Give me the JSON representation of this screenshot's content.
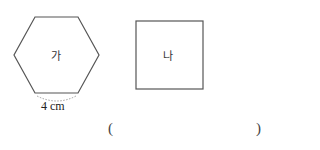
{
  "figures": {
    "hexagon": {
      "label": "가",
      "side_label": "4 cm",
      "stroke": "#555555"
    },
    "square": {
      "label": "나",
      "stroke": "#555555"
    }
  },
  "answer": {
    "open": "(",
    "close": ")",
    "value": ""
  }
}
